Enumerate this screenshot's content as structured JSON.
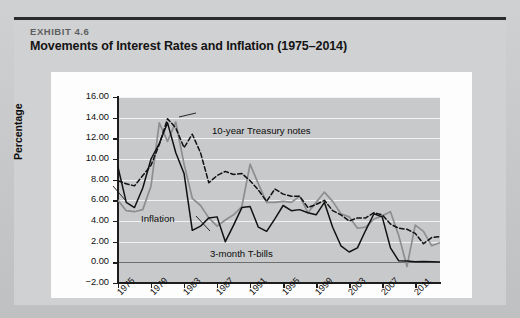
{
  "exhibit": {
    "label": "EXHIBIT 4.6",
    "title": "Movements of Interest Rates and Inflation (1975–2014)"
  },
  "colors": {
    "page_background": "#c9cacb",
    "card_background": "#d0d1d2",
    "panel_background": "#fdfdfd",
    "plot_background": "#c8c9ca",
    "gridline": "#f2f2f2",
    "axis": "#1d1d1d",
    "zero_line": "#6d6e70",
    "treasury_notes": "#111111",
    "tbills": "#111111",
    "inflation": "#8c8e90"
  },
  "chart_data": {
    "type": "line",
    "title": "Movements of Interest Rates and Inflation (1975–2014)",
    "xlabel": "",
    "ylabel": "Percentage",
    "xlim": [
      1975,
      2014
    ],
    "ylim": [
      -2.0,
      16.0
    ],
    "grid": true,
    "legend": "annotations",
    "ytick_labels": [
      "16.00",
      "14.00",
      "12.00",
      "10.00",
      "8.00",
      "6.00",
      "4.00",
      "2.00",
      "0.00",
      "−2.00"
    ],
    "ytick_values": [
      16,
      14,
      12,
      10,
      8,
      6,
      4,
      2,
      0,
      -2
    ],
    "xtick_labels": [
      "1975",
      "1979",
      "1983",
      "1987",
      "1991",
      "1995",
      "1999",
      "2003",
      "2007",
      "2011"
    ],
    "xtick_values": [
      1975,
      1979,
      1983,
      1987,
      1991,
      1995,
      1999,
      2003,
      2007,
      2011
    ],
    "x": [
      1975,
      1976,
      1977,
      1978,
      1979,
      1980,
      1981,
      1982,
      1983,
      1984,
      1985,
      1986,
      1987,
      1988,
      1989,
      1990,
      1991,
      1992,
      1993,
      1994,
      1995,
      1996,
      1997,
      1998,
      1999,
      2000,
      2001,
      2002,
      2003,
      2004,
      2005,
      2006,
      2007,
      2008,
      2009,
      2010,
      2011,
      2012,
      2013,
      2014
    ],
    "series": [
      {
        "name": "10-year Treasury notes",
        "style": "dashed",
        "color": "#111111",
        "values": [
          7.9,
          7.6,
          7.4,
          8.4,
          9.4,
          11.4,
          13.9,
          13.0,
          11.1,
          12.4,
          10.6,
          7.7,
          8.4,
          8.8,
          8.5,
          8.6,
          7.9,
          7.0,
          5.9,
          7.1,
          6.6,
          6.4,
          6.4,
          5.3,
          5.6,
          6.0,
          5.0,
          4.6,
          4.0,
          4.3,
          4.3,
          4.8,
          4.6,
          3.7,
          3.3,
          3.2,
          2.8,
          1.8,
          2.4,
          2.5
        ]
      },
      {
        "name": "3-month T-bills",
        "style": "solid",
        "color": "#111111",
        "values": [
          9.2,
          5.8,
          5.3,
          7.2,
          10.0,
          11.5,
          13.5,
          10.6,
          8.6,
          3.1,
          3.5,
          4.3,
          4.4,
          2.0,
          3.6,
          5.3,
          5.4,
          3.4,
          3.0,
          4.2,
          5.5,
          5.0,
          5.1,
          4.8,
          4.6,
          5.8,
          3.4,
          1.6,
          1.0,
          1.4,
          3.1,
          4.7,
          4.4,
          1.4,
          0.15,
          0.14,
          0.05,
          0.09,
          0.06,
          0.03
        ]
      },
      {
        "name": "Inflation",
        "style": "solid",
        "color": "#8c8e90",
        "values": [
          6.0,
          5.0,
          4.9,
          5.1,
          7.4,
          13.5,
          11.7,
          13.6,
          9.5,
          6.2,
          5.5,
          4.3,
          3.5,
          4.1,
          4.6,
          5.4,
          9.5,
          7.6,
          5.8,
          5.8,
          5.9,
          5.8,
          6.4,
          4.8,
          5.8,
          6.8,
          5.9,
          4.7,
          4.4,
          3.3,
          3.4,
          4.2,
          4.5,
          4.9,
          2.6,
          -0.4,
          3.6,
          3.0,
          1.6,
          1.9
        ]
      }
    ],
    "annotations": [
      {
        "text": "10-year Treasury notes",
        "series": "10-year Treasury notes"
      },
      {
        "text": "Inflation",
        "series": "Inflation"
      },
      {
        "text": "3-month T-bills",
        "series": "3-month T-bills"
      }
    ]
  }
}
